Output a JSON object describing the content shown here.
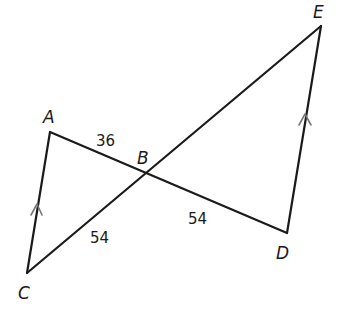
{
  "diagram": {
    "type": "geometry",
    "points": {
      "A": {
        "label": "A",
        "x": 50,
        "y": 132
      },
      "B": {
        "label": "B",
        "x": 146,
        "y": 174
      },
      "C": {
        "label": "C",
        "x": 27,
        "y": 273
      },
      "D": {
        "label": "D",
        "x": 287,
        "y": 233
      },
      "E": {
        "label": "E",
        "x": 321,
        "y": 26
      }
    },
    "segments": [
      {
        "from": "A",
        "to": "C",
        "parallel_mark": true
      },
      {
        "from": "A",
        "to": "D",
        "through": "B"
      },
      {
        "from": "C",
        "to": "E",
        "through": "B"
      },
      {
        "from": "D",
        "to": "E",
        "parallel_mark": true
      }
    ],
    "measures": {
      "AB": "36",
      "BC": "54",
      "BD": "54"
    },
    "colors": {
      "line": "#1a1a1a",
      "parallel_mark": "#777777",
      "background": "#ffffff"
    }
  }
}
